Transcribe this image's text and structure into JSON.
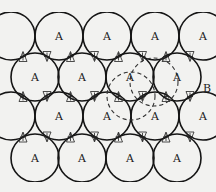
{
  "diagram": {
    "title": "",
    "sphere_radius": 24,
    "rows": [
      {
        "y": 36,
        "x": [
          11,
          59,
          107,
          155,
          203
        ],
        "labels": [
          "",
          "A",
          "A",
          "A",
          "A"
        ]
      },
      {
        "y": 77,
        "x": [
          35,
          82,
          130,
          177
        ],
        "labels": [
          "A",
          "A",
          "A",
          "A"
        ]
      },
      {
        "y": 116,
        "x": [
          11,
          59,
          107,
          155,
          203
        ],
        "labels": [
          "",
          "A",
          "A",
          "A",
          "A"
        ]
      },
      {
        "y": 158,
        "x": [
          35,
          82,
          130,
          177
        ],
        "labels": [
          "A",
          "A",
          "A",
          "A"
        ]
      }
    ],
    "dashed_spheres": [
      {
        "cx": 131,
        "cy": 96
      },
      {
        "cx": 154,
        "cy": 82
      }
    ],
    "side_label": {
      "text": "B",
      "x": 203,
      "y": 92
    },
    "gap_label_b": "B",
    "gap_label_c": "C",
    "label_a": "A"
  }
}
